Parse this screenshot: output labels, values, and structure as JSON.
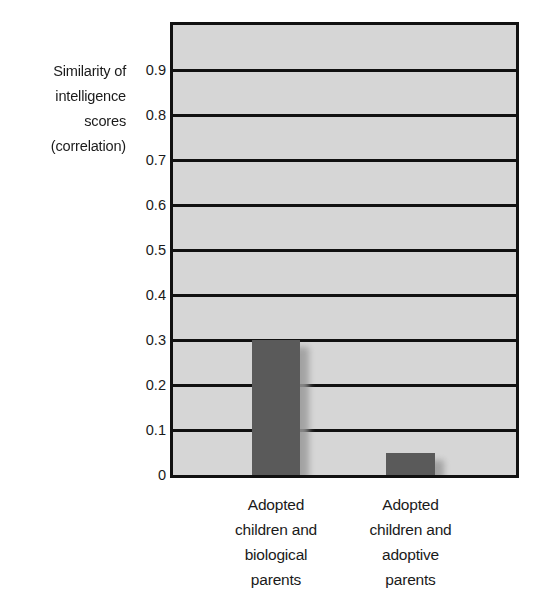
{
  "chart_data": {
    "type": "bar",
    "title": "",
    "subtitle": "",
    "xlabel": "",
    "ylabel": "Similarity of intelligence scores (correlation)",
    "ylabel_lines": [
      "Similarity of",
      "intelligence",
      "scores",
      "(correlation)"
    ],
    "categories": [
      "Adopted children and biological parents",
      "Adopted children and adoptive parents"
    ],
    "category_lines": [
      [
        "Adopted",
        "children and",
        "biological",
        "parents"
      ],
      [
        "Adopted",
        "children and",
        "adoptive",
        "parents"
      ]
    ],
    "values": [
      0.3,
      0.05
    ],
    "ylim": [
      0,
      1.0
    ],
    "ytick_values": [
      0,
      0.1,
      0.2,
      0.3,
      0.4,
      0.5,
      0.6,
      0.7,
      0.8,
      0.9
    ],
    "ytick_labels": [
      "0",
      "0.1",
      "0.2",
      "0.3",
      "0.4",
      "0.5",
      "0.6",
      "0.7",
      "0.8",
      "0.9"
    ],
    "grid": true,
    "grid_axis": "y",
    "legend": false,
    "legend_position": "none",
    "colors": {
      "bar_fill": "#5a5a5a",
      "bar_shadow": "#9a9a9a",
      "plot_background": "#d6d6d6",
      "page_background": "#ffffff",
      "gridline": "#111111",
      "frame": "#111111",
      "text": "#1a1a1a"
    }
  }
}
